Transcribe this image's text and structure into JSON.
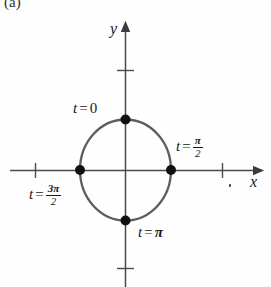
{
  "figure": {
    "panel_tag": "(a)",
    "background_color": "#fefefe",
    "ink_color": "#17171a",
    "curve_color": "#55555c"
  },
  "axes": {
    "x_label": "x",
    "y_label": "y",
    "x_axis": {
      "y": 170,
      "x_start": 10,
      "x_end": 263,
      "arrow": "right",
      "ticks": [
        35,
        222
      ]
    },
    "y_axis": {
      "x": 125,
      "y_start": 287,
      "y_end": 22,
      "arrow": "up",
      "ticks": [
        70,
        268
      ]
    }
  },
  "circle": {
    "center_x": 125,
    "center_y": 170,
    "radius_x": 46,
    "radius_y": 51,
    "stroke_width": 2.2
  },
  "points": [
    {
      "name": "t-zero-point",
      "x": 125,
      "y": 119,
      "label": "t = 0"
    },
    {
      "name": "t-pi-over-2-point",
      "x": 171,
      "y": 170,
      "label": "t = π/2"
    },
    {
      "name": "t-pi-point",
      "x": 125,
      "y": 220,
      "label": "t = π"
    },
    {
      "name": "t-3pi-over-2-point",
      "x": 80,
      "y": 170,
      "label": "t = 3π/2"
    }
  ],
  "labels": {
    "t_zero": {
      "var": "t",
      "eq": "=",
      "value": "0"
    },
    "t_pi_over_2": {
      "var": "t",
      "eq": "=",
      "numerator": "π",
      "denominator": "2"
    },
    "t_pi": {
      "var": "t",
      "eq": "=",
      "value": "π"
    },
    "t_3pi_over_2": {
      "var": "t",
      "eq": "=",
      "numerator": "3π",
      "denominator": "2"
    }
  }
}
